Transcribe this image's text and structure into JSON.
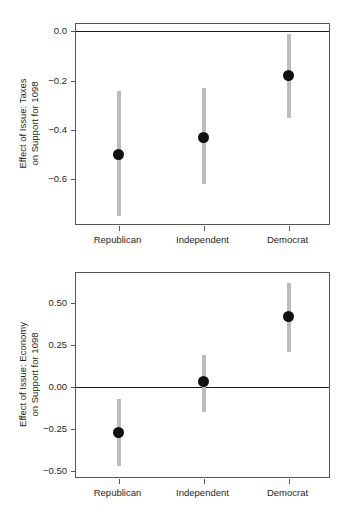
{
  "chart_data": [
    {
      "id": "taxes",
      "type": "scatter",
      "title": "",
      "xlabel": "",
      "ylabel": "Effect of Issue: Taxes\non Support for 1098",
      "ylabel_lines": [
        "Effect of Issue: Taxes",
        "on Support for 1098"
      ],
      "categories": [
        "Republican",
        "Independent",
        "Democrat"
      ],
      "values": [
        -0.5,
        -0.43,
        -0.18
      ],
      "ci_low": [
        -0.75,
        -0.62,
        -0.35
      ],
      "ci_high": [
        -0.24,
        -0.23,
        -0.01
      ],
      "yticks": [
        0.0,
        -0.2,
        -0.4,
        -0.6
      ],
      "ytick_labels": [
        "0.0",
        "−0.2",
        "−0.4",
        "−0.6"
      ],
      "ylim": [
        -0.79,
        0.03
      ],
      "reference_line": 0.0,
      "grid": false,
      "legend": "none"
    },
    {
      "id": "economy",
      "type": "scatter",
      "title": "",
      "xlabel": "",
      "ylabel": "Effect of Issue: Economy\non Support for 1098",
      "ylabel_lines": [
        "Effect of Issue: Economy",
        "on Support for 1098"
      ],
      "categories": [
        "Republican",
        "Independent",
        "Democrat"
      ],
      "values": [
        -0.27,
        0.03,
        0.42
      ],
      "ci_low": [
        -0.47,
        -0.15,
        0.21
      ],
      "ci_high": [
        -0.07,
        0.19,
        0.62
      ],
      "yticks": [
        0.5,
        0.25,
        0.0,
        -0.25,
        -0.5
      ],
      "ytick_labels": [
        "0.50",
        "0.25",
        "0.00",
        "−0.25",
        "−0.50"
      ],
      "ylim": [
        -0.55,
        0.68
      ],
      "reference_line": 0.0,
      "grid": false,
      "legend": "none"
    }
  ],
  "colors": {
    "point": "#111111",
    "errorbar": "#bcbcbc",
    "reference_line": "#1a1a1a",
    "frame": "#575757",
    "text": "#231f20",
    "background": "#ffffff"
  }
}
